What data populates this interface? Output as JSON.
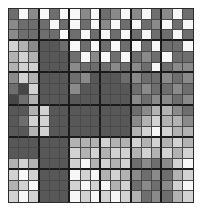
{
  "figure": {
    "title": "",
    "kind": "grayscale-grid-heatmap",
    "rows": 18,
    "cols": 18,
    "block_size": 3,
    "background_color": "#ffffff",
    "border_color": "#2b2b2b",
    "cell_grid_line_color": "#4a4a4a",
    "block_line_color": "#1a1a1a"
  },
  "chart_data": {
    "type": "heatmap",
    "title": "",
    "xlabel": "",
    "ylabel": "",
    "x": [
      1,
      2,
      3,
      4,
      5,
      6,
      7,
      8,
      9,
      10,
      11,
      12,
      13,
      14,
      15,
      16,
      17,
      18
    ],
    "y": [
      1,
      2,
      3,
      4,
      5,
      6,
      7,
      8,
      9,
      10,
      11,
      12,
      13,
      14,
      15,
      16,
      17,
      18
    ],
    "grid": true,
    "legend": "none",
    "colormap": "gray",
    "vmin": 0,
    "vmax": 255,
    "palette": {
      "white": "#f7f7f7",
      "light": "#d2d2d2",
      "midlight": "#a8a8a8",
      "mid": "#8a8a8a",
      "middark": "#6e6e6e",
      "dark": "#585858",
      "darker": "#4a4a4a",
      "darkest": "#3c3c3c"
    },
    "values": [
      [
        110,
        247,
        138,
        247,
        110,
        247,
        247,
        138,
        247,
        110,
        138,
        247,
        138,
        247,
        110,
        138,
        247,
        110
      ],
      [
        138,
        110,
        110,
        110,
        247,
        110,
        247,
        110,
        247,
        138,
        247,
        110,
        247,
        110,
        138,
        247,
        110,
        247
      ],
      [
        138,
        110,
        110,
        110,
        110,
        247,
        110,
        247,
        110,
        247,
        110,
        247,
        110,
        247,
        110,
        110,
        247,
        110
      ],
      [
        210,
        178,
        138,
        88,
        88,
        110,
        247,
        110,
        247,
        110,
        247,
        110,
        247,
        110,
        247,
        110,
        110,
        247
      ],
      [
        178,
        210,
        178,
        88,
        88,
        88,
        110,
        247,
        138,
        247,
        110,
        247,
        110,
        138,
        110,
        247,
        110,
        110
      ],
      [
        178,
        210,
        210,
        88,
        88,
        88,
        138,
        110,
        110,
        110,
        138,
        110,
        138,
        110,
        247,
        110,
        138,
        138
      ],
      [
        138,
        210,
        178,
        88,
        88,
        88,
        110,
        138,
        88,
        88,
        88,
        110,
        138,
        110,
        110,
        138,
        110,
        138
      ],
      [
        110,
        70,
        210,
        88,
        88,
        88,
        138,
        88,
        88,
        88,
        88,
        88,
        110,
        138,
        110,
        110,
        138,
        110
      ],
      [
        70,
        110,
        178,
        88,
        88,
        88,
        88,
        88,
        88,
        88,
        88,
        88,
        138,
        110,
        138,
        138,
        110,
        138
      ],
      [
        88,
        88,
        178,
        210,
        88,
        88,
        88,
        88,
        88,
        88,
        88,
        88,
        110,
        138,
        178,
        178,
        138,
        110
      ],
      [
        88,
        110,
        210,
        210,
        88,
        88,
        88,
        88,
        88,
        88,
        88,
        88,
        138,
        178,
        210,
        178,
        178,
        138
      ],
      [
        88,
        88,
        178,
        210,
        88,
        88,
        88,
        88,
        88,
        88,
        88,
        88,
        178,
        210,
        247,
        210,
        178,
        178
      ],
      [
        88,
        88,
        88,
        88,
        88,
        88,
        178,
        178,
        178,
        210,
        178,
        178,
        210,
        178,
        210,
        178,
        210,
        178
      ],
      [
        88,
        88,
        88,
        88,
        88,
        88,
        210,
        178,
        210,
        178,
        210,
        210,
        178,
        210,
        178,
        210,
        178,
        210
      ],
      [
        178,
        210,
        178,
        88,
        88,
        88,
        210,
        247,
        178,
        210,
        178,
        210,
        110,
        138,
        110,
        138,
        210,
        247
      ],
      [
        210,
        247,
        210,
        88,
        88,
        88,
        247,
        210,
        247,
        178,
        210,
        178,
        138,
        110,
        138,
        110,
        178,
        210
      ],
      [
        178,
        210,
        247,
        88,
        88,
        88,
        210,
        247,
        210,
        247,
        178,
        210,
        110,
        138,
        110,
        138,
        210,
        247
      ],
      [
        210,
        247,
        210,
        88,
        88,
        88,
        247,
        210,
        247,
        210,
        247,
        210,
        178,
        110,
        138,
        110,
        178,
        210
      ]
    ]
  }
}
